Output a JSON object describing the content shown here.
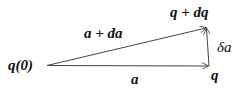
{
  "diagram": {
    "type": "vector-triangle",
    "labels": {
      "origin": "q(0)",
      "bottom_vector": "a",
      "top_vector": "a + da",
      "top_endpoint": "q + dq",
      "bottom_endpoint": "q",
      "delta_vector": "δa"
    },
    "colors": {
      "line": "#444444",
      "text": "#111111"
    }
  }
}
